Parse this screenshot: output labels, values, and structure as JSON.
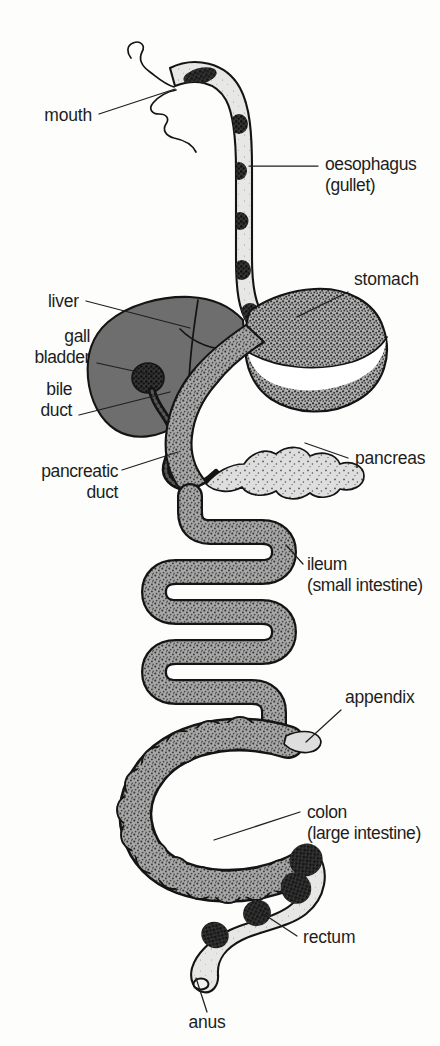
{
  "figure": {
    "background_color": "#fdfdfc",
    "ink_color": "#141414",
    "label_color": "#1d1d1d"
  },
  "palette": {
    "liver_fill": "#6e6e6e",
    "stomach_fill": "#b9b9b9",
    "intestine_fill": "#9a9a9a",
    "colon_fill": "#9a9a9a",
    "pancreas_fill": "#dcdcdc",
    "lumen_fill": "#e7e7e5",
    "bolus_fill": "#2a2a2a",
    "appendix_fill": "#dedede",
    "rectum_fill": "#e3e3e1"
  },
  "labels": [
    {
      "id": "mouth",
      "name": "mouth",
      "text": "mouth",
      "lines": [
        "mouth"
      ],
      "anchor": "end",
      "x": 92,
      "y": 121,
      "leader": "M 99 114 L 175 89"
    },
    {
      "id": "oesophagus",
      "name": "oesophagus",
      "text": "oesophagus (gullet)",
      "lines": [
        "oesophagus",
        "(gullet)"
      ],
      "anchor": "start",
      "x": 325,
      "y": 170,
      "leader": "M 249 166 L 318 166"
    },
    {
      "id": "stomach",
      "name": "stomach",
      "text": "stomach",
      "lines": [
        "stomach"
      ],
      "anchor": "start",
      "x": 354,
      "y": 285,
      "leader": "M 348 292 L 297 317"
    },
    {
      "id": "liver",
      "name": "liver",
      "text": "liver",
      "lines": [
        "liver"
      ],
      "anchor": "end",
      "x": 79,
      "y": 307,
      "leader": "M 86 301 L 190 328"
    },
    {
      "id": "gall-bladder",
      "name": "gall-bladder",
      "text": "gall bladder",
      "lines": [
        "gall",
        "bladder"
      ],
      "anchor": "end",
      "x": 90,
      "y": 342,
      "leader": "M 97 363 L 152 375"
    },
    {
      "id": "bile-duct",
      "name": "bile-duct",
      "text": "bile duct",
      "lines": [
        "bile",
        "duct"
      ],
      "anchor": "end",
      "x": 72,
      "y": 395,
      "leader": "M 79 415 L 170 392"
    },
    {
      "id": "pancreatic-duct",
      "name": "pancreatic-duct",
      "text": "pancreatic duct",
      "lines": [
        "pancreatic",
        "duct"
      ],
      "anchor": "end",
      "x": 118,
      "y": 477,
      "leader": "M 122 470 L 178 452"
    },
    {
      "id": "pancreas",
      "name": "pancreas",
      "text": "pancreas",
      "lines": [
        "pancreas"
      ],
      "anchor": "start",
      "x": 355,
      "y": 464,
      "leader": "M 348 458 L 305 443"
    },
    {
      "id": "ileum",
      "name": "ileum",
      "text": "ileum (small intestine)",
      "lines": [
        "ileum",
        "(small intestine)"
      ],
      "anchor": "start",
      "x": 307,
      "y": 570,
      "leader": "M 303 564 L 286 545"
    },
    {
      "id": "appendix",
      "name": "appendix",
      "text": "appendix",
      "lines": [
        "appendix"
      ],
      "anchor": "start",
      "x": 345,
      "y": 703,
      "leader": "M 341 710 L 306 742"
    },
    {
      "id": "colon",
      "name": "colon",
      "text": "colon (large intestine)",
      "lines": [
        "colon",
        "(large intestine)"
      ],
      "anchor": "start",
      "x": 307,
      "y": 818,
      "leader": "M 300 812 L 214 840"
    },
    {
      "id": "rectum",
      "name": "rectum",
      "text": "rectum",
      "lines": [
        "rectum"
      ],
      "anchor": "start",
      "x": 303,
      "y": 943,
      "leader": "M 297 936 L 262 913"
    },
    {
      "id": "anus",
      "name": "anus",
      "text": "anus",
      "lines": [
        "anus"
      ],
      "anchor": "middle",
      "x": 207,
      "y": 1028,
      "leader": "M 207 1012 L 196 978"
    }
  ],
  "organs": [
    {
      "id": "mouth",
      "name": "mouth-cavity",
      "label": "mouth"
    },
    {
      "id": "oesophagus",
      "name": "oesophagus-tube",
      "label": "oesophagus",
      "bolus_count": 6
    },
    {
      "id": "stomach",
      "name": "stomach-pouch",
      "label": "stomach"
    },
    {
      "id": "liver",
      "name": "liver-lobe",
      "label": "liver"
    },
    {
      "id": "gall-bladder",
      "name": "gall-bladder-sac",
      "label": "gall bladder"
    },
    {
      "id": "bile-duct",
      "name": "bile-duct-tube",
      "label": "bile duct"
    },
    {
      "id": "pancreas",
      "name": "pancreas-gland",
      "label": "pancreas"
    },
    {
      "id": "pancreatic-duct",
      "name": "pancreatic-duct-tube",
      "label": "pancreatic duct"
    },
    {
      "id": "ileum",
      "name": "ileum-coils",
      "label": "ileum"
    },
    {
      "id": "appendix",
      "name": "appendix-tip",
      "label": "appendix"
    },
    {
      "id": "colon",
      "name": "colon-loop",
      "label": "colon"
    },
    {
      "id": "rectum",
      "name": "rectum-tube",
      "label": "rectum"
    },
    {
      "id": "anus",
      "name": "anus-opening",
      "label": "anus"
    }
  ]
}
